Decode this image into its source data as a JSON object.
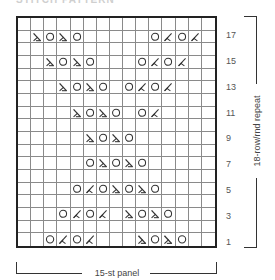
{
  "title": "STITCH PATTERN",
  "chart": {
    "columns": 15,
    "rows": 18,
    "symbols": {
      "yo": "circle",
      "k2tog": "right-leaning decrease",
      "ssk": "left-leaning decrease",
      "k": "blank"
    },
    "grid_rows_top_to_bottom": [
      {
        "row": 18,
        "cells": [
          "k",
          "k",
          "k",
          "k",
          "k",
          "k",
          "k",
          "k",
          "k",
          "k",
          "k",
          "k",
          "k",
          "k",
          "k"
        ]
      },
      {
        "row": 17,
        "cells": [
          "k",
          "ssk",
          "yo",
          "ssk",
          "yo",
          "k",
          "k",
          "k",
          "k",
          "k",
          "yo",
          "k2tog",
          "yo",
          "k2tog",
          "k"
        ]
      },
      {
        "row": 16,
        "cells": [
          "k",
          "k",
          "k",
          "k",
          "k",
          "k",
          "k",
          "k",
          "k",
          "k",
          "k",
          "k",
          "k",
          "k",
          "k"
        ]
      },
      {
        "row": 15,
        "cells": [
          "k",
          "k",
          "ssk",
          "yo",
          "ssk",
          "yo",
          "k",
          "k",
          "k",
          "yo",
          "k2tog",
          "yo",
          "k2tog",
          "k",
          "k"
        ]
      },
      {
        "row": 14,
        "cells": [
          "k",
          "k",
          "k",
          "k",
          "k",
          "k",
          "k",
          "k",
          "k",
          "k",
          "k",
          "k",
          "k",
          "k",
          "k"
        ]
      },
      {
        "row": 13,
        "cells": [
          "k",
          "k",
          "k",
          "ssk",
          "yo",
          "ssk",
          "yo",
          "k",
          "yo",
          "k2tog",
          "yo",
          "k2tog",
          "k",
          "k",
          "k"
        ]
      },
      {
        "row": 12,
        "cells": [
          "k",
          "k",
          "k",
          "k",
          "k",
          "k",
          "k",
          "k",
          "k",
          "k",
          "k",
          "k",
          "k",
          "k",
          "k"
        ]
      },
      {
        "row": 11,
        "cells": [
          "k",
          "k",
          "k",
          "k",
          "ssk",
          "yo",
          "ssk",
          "yo",
          "k",
          "yo",
          "k2tog",
          "k",
          "k",
          "k",
          "k"
        ]
      },
      {
        "row": 10,
        "cells": [
          "k",
          "k",
          "k",
          "k",
          "k",
          "k",
          "k",
          "k",
          "k",
          "k",
          "k",
          "k",
          "k",
          "k",
          "k"
        ]
      },
      {
        "row": 9,
        "cells": [
          "k",
          "k",
          "k",
          "k",
          "k",
          "ssk",
          "yo",
          "ssk",
          "yo",
          "k",
          "k",
          "k",
          "k",
          "k",
          "k"
        ]
      },
      {
        "row": 8,
        "cells": [
          "k",
          "k",
          "k",
          "k",
          "k",
          "k",
          "k",
          "k",
          "k",
          "k",
          "k",
          "k",
          "k",
          "k",
          "k"
        ]
      },
      {
        "row": 7,
        "cells": [
          "k",
          "k",
          "k",
          "k",
          "k",
          "yo",
          "ssk",
          "yo",
          "ssk",
          "yo",
          "k",
          "k",
          "k",
          "k",
          "k"
        ]
      },
      {
        "row": 6,
        "cells": [
          "k",
          "k",
          "k",
          "k",
          "k",
          "k",
          "k",
          "k",
          "k",
          "k",
          "k",
          "k",
          "k",
          "k",
          "k"
        ]
      },
      {
        "row": 5,
        "cells": [
          "k",
          "k",
          "k",
          "k",
          "yo",
          "k2tog",
          "yo",
          "ssk",
          "yo",
          "ssk",
          "yo",
          "k",
          "k",
          "k",
          "k"
        ]
      },
      {
        "row": 4,
        "cells": [
          "k",
          "k",
          "k",
          "k",
          "k",
          "k",
          "k",
          "k",
          "k",
          "k",
          "k",
          "k",
          "k",
          "k",
          "k"
        ]
      },
      {
        "row": 3,
        "cells": [
          "k",
          "k",
          "k",
          "yo",
          "k2tog",
          "yo",
          "k2tog",
          "k",
          "ssk",
          "yo",
          "ssk",
          "yo",
          "k",
          "k",
          "k"
        ]
      },
      {
        "row": 2,
        "cells": [
          "k",
          "k",
          "k",
          "k",
          "k",
          "k",
          "k",
          "k",
          "k",
          "k",
          "k",
          "k",
          "k",
          "k",
          "k"
        ]
      },
      {
        "row": 1,
        "cells": [
          "k",
          "k",
          "yo",
          "k2tog",
          "yo",
          "k2tog",
          "k",
          "k",
          "k",
          "ssk",
          "yo",
          "ssk",
          "yo",
          "k",
          "k"
        ]
      }
    ],
    "row_labels": [
      "17",
      "15",
      "13",
      "11",
      "9",
      "7",
      "5",
      "3",
      "1"
    ],
    "repeat_label": "18-row/rnd repeat",
    "panel_label": "15-st panel",
    "colors": {
      "grid_line": "#8a8a8a",
      "border": "#222222",
      "symbol": "#333333"
    }
  }
}
